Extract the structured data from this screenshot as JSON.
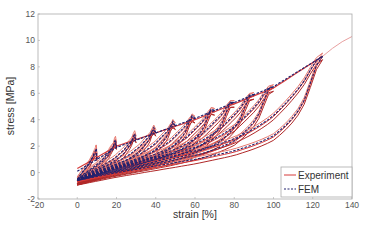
{
  "chart_data": {
    "type": "line",
    "title": "",
    "xlabel": "strain [%]",
    "ylabel": "stress [MPa]",
    "xlim": [
      -20,
      140
    ],
    "ylim": [
      -2,
      12
    ],
    "xticks": [
      -20,
      0,
      20,
      40,
      60,
      80,
      100,
      120,
      140
    ],
    "yticks": [
      -2,
      0,
      2,
      4,
      6,
      8,
      10,
      12
    ],
    "grid": false,
    "legend": {
      "position": "lower right",
      "entries": [
        "Experiment",
        "FEM"
      ]
    },
    "colors": {
      "Experiment": "#d63a3a",
      "FEM": "#22226e",
      "axis": "#999999"
    },
    "cycle_peaks": [
      {
        "strain": 10,
        "stress": 1.5
      },
      {
        "strain": 20,
        "stress": 2.0
      },
      {
        "strain": 30,
        "stress": 2.5
      },
      {
        "strain": 40,
        "stress": 3.0
      },
      {
        "strain": 50,
        "stress": 3.5
      },
      {
        "strain": 60,
        "stress": 4.0
      },
      {
        "strain": 70,
        "stress": 4.6
      },
      {
        "strain": 80,
        "stress": 5.2
      },
      {
        "strain": 90,
        "stress": 5.8
      },
      {
        "strain": 100,
        "stress": 6.4
      },
      {
        "strain": 125,
        "stress": 8.8
      }
    ],
    "series": [
      {
        "name": "Experiment",
        "style": "solid",
        "loading_envelope": [
          [
            0,
            0.3
          ],
          [
            20,
            2.0
          ],
          [
            40,
            3.0
          ],
          [
            60,
            4.0
          ],
          [
            80,
            5.2
          ],
          [
            100,
            6.4
          ],
          [
            125,
            8.8
          ]
        ],
        "tail": [
          [
            125,
            8.8
          ],
          [
            130,
            9.4
          ],
          [
            135,
            9.9
          ],
          [
            140,
            10.3
          ]
        ],
        "lowest_unloading": [
          [
            125,
            8.2
          ],
          [
            120,
            5.0
          ],
          [
            115,
            3.4
          ],
          [
            100,
            2.3
          ],
          [
            80,
            1.5
          ],
          [
            60,
            0.9
          ],
          [
            40,
            0.4
          ],
          [
            20,
            -0.1
          ],
          [
            0,
            -0.7
          ]
        ]
      },
      {
        "name": "FEM",
        "style": "dashed",
        "loading_envelope": [
          [
            0,
            0.1
          ],
          [
            20,
            1.9
          ],
          [
            40,
            3.0
          ],
          [
            60,
            4.1
          ],
          [
            80,
            5.3
          ],
          [
            100,
            6.5
          ],
          [
            125,
            8.8
          ]
        ],
        "lowest_unloading": [
          [
            125,
            8.6
          ],
          [
            120,
            5.2
          ],
          [
            115,
            3.5
          ],
          [
            100,
            2.4
          ],
          [
            80,
            1.6
          ],
          [
            60,
            1.0
          ],
          [
            40,
            0.5
          ],
          [
            20,
            0.0
          ],
          [
            0,
            -0.6
          ]
        ]
      }
    ]
  }
}
